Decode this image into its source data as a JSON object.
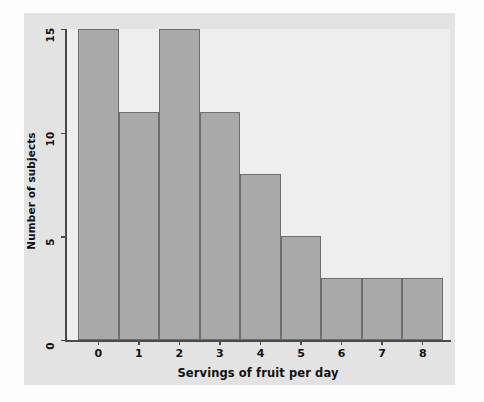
{
  "chart_data": {
    "type": "bar",
    "title": "",
    "subtitle": "",
    "xlabel": "Servings of fruit per day",
    "ylabel": "Number of subjects",
    "categories": [
      "0",
      "1",
      "2",
      "3",
      "4",
      "5",
      "6",
      "7",
      "8"
    ],
    "values": [
      15,
      11,
      15,
      11,
      8,
      5,
      3,
      3,
      3
    ],
    "xtick_labels": [
      "0",
      "1",
      "2",
      "3",
      "4",
      "5",
      "6",
      "7",
      "8"
    ],
    "ytick_labels": [
      "0",
      "5",
      "10",
      "15"
    ],
    "ytick_values": [
      0,
      5,
      10,
      15
    ],
    "ylim": [
      0,
      15
    ],
    "xlim": [
      -0.5,
      8.5
    ],
    "grid": false,
    "legend": null,
    "legend_position": "none",
    "annotations": [],
    "series": [
      {
        "name": "Number of subjects",
        "values": [
          15,
          11,
          15,
          11,
          8,
          5,
          3,
          3,
          3
        ]
      }
    ]
  },
  "style": {
    "bar_fill": "#a9a9a9",
    "bar_border": "#6e6e6e",
    "plot_background": "#eeeeee",
    "figure_background": "#e3e3e3",
    "page_background": "#fdfdfd",
    "axis_color": "#4a4a4a",
    "text_color": "#121212"
  }
}
